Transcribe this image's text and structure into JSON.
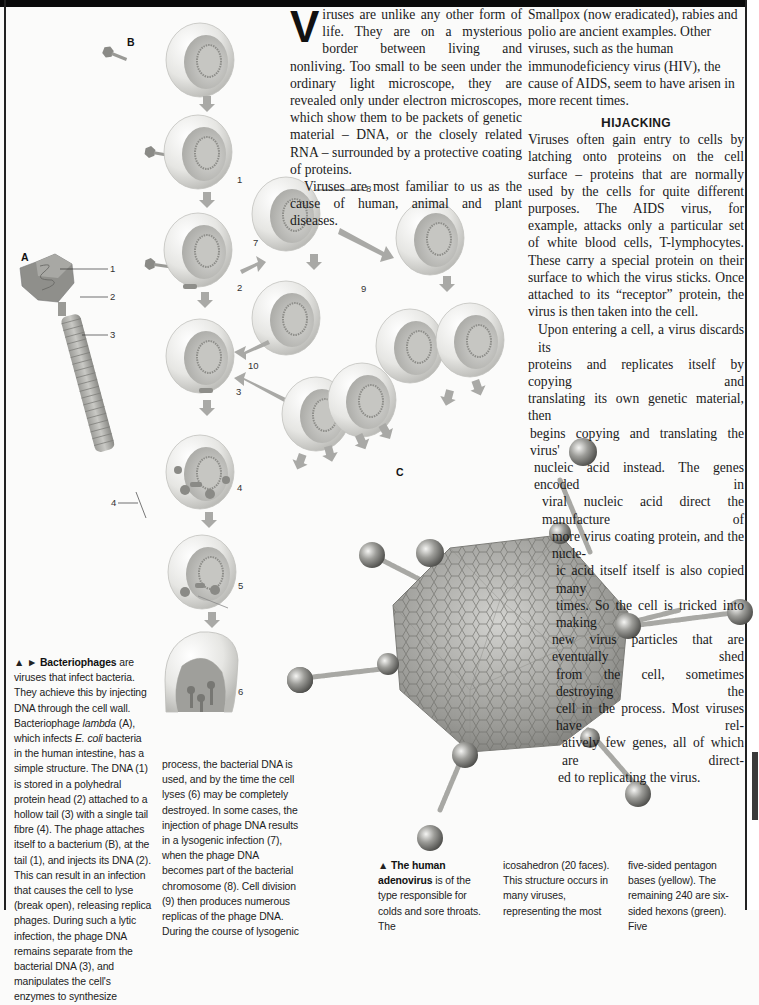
{
  "article": {
    "dropcap": "V",
    "col1": {
      "p1_rest": "iruses are unlike any other form of life. They are on a mysterious border between living and nonliving. Too small to be seen under the ordinary light microscope, they are revealed only under electron microscopes, which show them to be packets of genetic material – DNA, or the closely related RNA – surrounded by a protective coating of proteins.",
      "p2": "Viruses are most familiar to us as the cause of human, animal and plant diseases."
    },
    "col2": {
      "p1": "Smallpox (now eradicated), rabies and polio are ancient examples. Other viruses, such as the human immunodeficiency virus (HIV), the cause of AIDS, seem to have arisen in more recent times.",
      "heading_initial": "H",
      "heading_rest": "IJACKING",
      "p2": "Viruses often gain entry to cells by latching onto proteins on the cell surface – proteins that are normally used by the cells for quite different purposes. The AIDS virus, for example, attacks only a particular set of white blood cells, T-lymphocytes. These carry a special protein on their surface to which the virus sticks. Once attached to its “receptor” protein, the virus is then taken into the cell.",
      "p3_lines": [
        "Upon entering a cell, a virus discards its",
        "proteins and replicates itself by copying and",
        "translating its own genetic material, then",
        "begins copying and translating the virus'",
        "nucleic acid instead. The genes encoded in",
        "viral nucleic acid direct the manufacture of",
        "more virus coating protein, and the nucle-",
        "ic acid itself itself is also copied many",
        "times. So the cell is tricked into making",
        "new virus particles that are eventually shed",
        "from the cell, sometimes destroying the",
        "cell in the process. Most viruses have rel-",
        "atively few genes, all of which are direct-",
        "ed to replicating the virus."
      ]
    }
  },
  "captions": {
    "bacteriophages": {
      "marker": "▲ ► ",
      "title": "Bacteriophages",
      "text1": " are viruses that infect bacteria. They achieve this by injecting DNA through the cell wall. Bacteriophage ",
      "italic1": "lambda",
      "text2": " (A), which infects ",
      "italic2": "E. coli",
      "text3": " bacteria in the human intestine, has a simple structure. The DNA (1) is stored in a polyhedral protein head (2) attached to a hollow tail (3) with a single tail fibre (4). The phage attaches itself to a bacterium (B), at the tail (1), and injects its DNA (2). This can result in an infection that causes the cell to lyse (break open), releasing replica phages. During such a lytic infection, the phage DNA remains separate from the bacterial DNA (3), and manipulates the cell's enzymes to synthesize",
      "continued": "process, the bacterial DNA is used, and by the time the cell lyses (6) may be completely destroyed. In some cases, the injection of phage DNA results in a lysogenic infection (7), when the phage DNA becomes part of the bacterial chromosome (8). Cell division (9) then produces numerous replicas of the phage DNA. During the course of lysogenic"
    },
    "adenovirus": {
      "marker": "▲ ",
      "title": "The human adenovirus",
      "col1": " is of the type responsible for colds and sore throats. The",
      "col2": "icosahedron (20 faces). This structure occurs in many viruses, representing the most",
      "col3": "five-sided pentagon bases (yellow). The remaining 240 are six-sided hexons (green). Five"
    }
  },
  "figure_labels": {
    "A": "A",
    "B": "B",
    "C": "C",
    "phage_parts": [
      "1",
      "2",
      "3",
      "4"
    ],
    "steps": [
      "1",
      "2",
      "3",
      "4",
      "5",
      "6",
      "7",
      "8",
      "9",
      "10"
    ]
  },
  "colors": {
    "text": "#1a1a1a",
    "rule": "#222222",
    "cell_light": "#f2f2f0",
    "cell_mid": "#c9c9c6",
    "phage": "#8a8a86",
    "arrow": "#a9a9a6"
  }
}
